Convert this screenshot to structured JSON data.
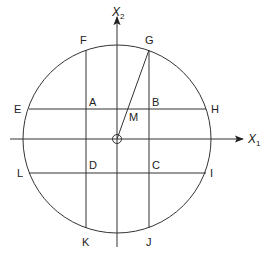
{
  "diagram": {
    "axes": {
      "x_label": "X",
      "x_subscript": "1",
      "y_label": "X",
      "y_subscript": "2"
    },
    "points": {
      "A": "A",
      "B": "B",
      "C": "C",
      "D": "D",
      "E": "E",
      "F": "F",
      "G": "G",
      "H": "H",
      "I": "I",
      "J": "J",
      "K": "K",
      "L": "L",
      "M": "M"
    },
    "colors": {
      "stroke": "#333333",
      "background": "#ffffff"
    }
  }
}
